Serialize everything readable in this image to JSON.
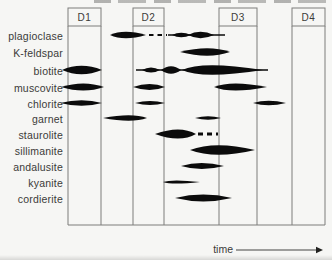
{
  "figure": {
    "background": "#f6f6f4",
    "line_color": "#7d7d7b",
    "ink_color": "#0b0b0b",
    "text_color": "#3b3b39",
    "box_top": 8,
    "box_bottom": 26,
    "chart_bottom": 225,
    "chart_left": 68,
    "chart_right": 325,
    "time_label": "time",
    "time_arrow": {
      "x1": 236,
      "x2": 316,
      "y": 250,
      "tip": 323
    }
  },
  "chart_data": {
    "type": "range-lens",
    "xlabel": "time",
    "phases": [
      {
        "label": "D1",
        "x1": 68,
        "x2": 101
      },
      {
        "label": "D2",
        "x1": 133,
        "x2": 164
      },
      {
        "label": "D3",
        "x1": 219,
        "x2": 257
      },
      {
        "label": "D4",
        "x1": 292,
        "x2": 325
      }
    ],
    "categories": [
      "plagioclase",
      "K-feldspar",
      "biotite",
      "muscovite",
      "chlorite",
      "garnet",
      "staurolite",
      "sillimanite",
      "andalusite",
      "kyanite",
      "cordierite"
    ],
    "rows": [
      {
        "mineral": "plagioclase",
        "y": 35,
        "shapes": [
          {
            "kind": "lens",
            "x1": 110,
            "x2": 146,
            "cx": 124,
            "h": 3.2
          },
          {
            "kind": "dashes",
            "x1": 149,
            "x2": 167,
            "th": 2.2,
            "dash": "4.5 4"
          },
          {
            "kind": "line",
            "x1": 168,
            "x2": 225,
            "th": 1.3
          },
          {
            "kind": "lens",
            "x1": 172,
            "x2": 191,
            "cx": 181,
            "h": 2.2
          },
          {
            "kind": "lens",
            "x1": 188,
            "x2": 214,
            "cx": 200,
            "h": 3.2
          }
        ]
      },
      {
        "mineral": "K-feldspar",
        "y": 52,
        "shapes": [
          {
            "kind": "lens",
            "x1": 180,
            "x2": 230,
            "cx": 209,
            "h": 3.7
          }
        ]
      },
      {
        "mineral": "biotite",
        "y": 70,
        "shapes": [
          {
            "kind": "lens",
            "x1": 62,
            "x2": 102,
            "cx": 81,
            "h": 4.2
          },
          {
            "kind": "line",
            "x1": 136,
            "x2": 268,
            "th": 1.6
          },
          {
            "kind": "lens",
            "x1": 142,
            "x2": 160,
            "cx": 151,
            "h": 2.6
          },
          {
            "kind": "lens",
            "x1": 161,
            "x2": 181,
            "cx": 171,
            "h": 3.8
          },
          {
            "kind": "lens",
            "x1": 182,
            "x2": 263,
            "cx": 202,
            "h": 4.8
          }
        ]
      },
      {
        "mineral": "muscovite",
        "y": 87,
        "shapes": [
          {
            "kind": "lens",
            "x1": 61,
            "x2": 104,
            "cx": 84,
            "h": 3.6
          },
          {
            "kind": "lens",
            "x1": 133,
            "x2": 165,
            "cx": 150,
            "h": 3.0
          },
          {
            "kind": "lens",
            "x1": 214,
            "x2": 267,
            "cx": 231,
            "h": 3.6
          }
        ]
      },
      {
        "mineral": "chlorite",
        "y": 103,
        "shapes": [
          {
            "kind": "lens",
            "x1": 60,
            "x2": 102,
            "cx": 82,
            "h": 2.8
          },
          {
            "kind": "lens",
            "x1": 135,
            "x2": 165,
            "cx": 150,
            "h": 2.0
          },
          {
            "kind": "lens",
            "x1": 253,
            "x2": 286,
            "cx": 268,
            "h": 2.3
          }
        ]
      },
      {
        "mineral": "garnet",
        "y": 118,
        "shapes": [
          {
            "kind": "lens",
            "x1": 103,
            "x2": 147,
            "cx": 132,
            "h": 2.7
          },
          {
            "kind": "lens",
            "x1": 195,
            "x2": 221,
            "cx": 208,
            "h": 1.7
          }
        ]
      },
      {
        "mineral": "staurolite",
        "y": 134,
        "shapes": [
          {
            "kind": "lens",
            "x1": 155,
            "x2": 196,
            "cx": 180,
            "h": 4.6
          },
          {
            "kind": "dashes",
            "x1": 198,
            "x2": 218,
            "th": 2.8,
            "dash": "5 4"
          }
        ]
      },
      {
        "mineral": "sillimanite",
        "y": 150,
        "shapes": [
          {
            "kind": "lens",
            "x1": 190,
            "x2": 255,
            "cx": 215,
            "h": 4.8
          }
        ]
      },
      {
        "mineral": "andalusite",
        "y": 166,
        "shapes": [
          {
            "kind": "lens",
            "x1": 181,
            "x2": 224,
            "cx": 201,
            "h": 3.0
          }
        ]
      },
      {
        "mineral": "kyanite",
        "y": 182,
        "shapes": [
          {
            "kind": "lens",
            "x1": 163,
            "x2": 200,
            "cx": 172,
            "h": 1.6
          }
        ]
      },
      {
        "mineral": "cordierite",
        "y": 198,
        "shapes": [
          {
            "kind": "lens",
            "x1": 175,
            "x2": 232,
            "cx": 203,
            "h": 3.4
          }
        ]
      }
    ]
  }
}
